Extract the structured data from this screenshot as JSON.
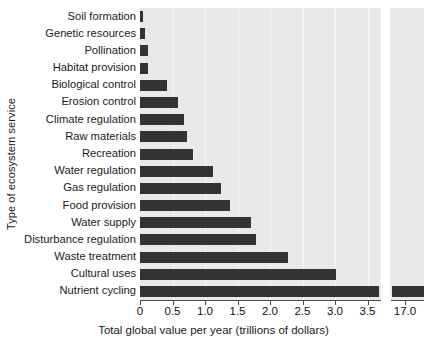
{
  "chart_data": {
    "type": "bar",
    "orientation": "horizontal",
    "title": "",
    "xlabel": "Total global value per year (trillions of dollars)",
    "ylabel": "Type of ecosystem service",
    "categories": [
      "Soil formation",
      "Genetic resources",
      "Pollination",
      "Habitat provision",
      "Biological control",
      "Erosion control",
      "Climate regulation",
      "Raw materials",
      "Recreation",
      "Water regulation",
      "Gas regulation",
      "Food provision",
      "Water supply",
      "Disturbance regulation",
      "Waste treatment",
      "Cultural uses",
      "Nutrient cycling"
    ],
    "values": [
      0.05,
      0.08,
      0.12,
      0.12,
      0.42,
      0.58,
      0.68,
      0.72,
      0.82,
      1.12,
      1.25,
      1.38,
      1.7,
      1.78,
      2.28,
      3.02,
      17.0
    ],
    "xticklabels": [
      "0",
      "0.5",
      "1.0",
      "1.5",
      "2.0",
      "2.5",
      "3.0",
      "3.5",
      "17.0"
    ],
    "xtickvalues": [
      0,
      0.5,
      1.0,
      1.5,
      2.0,
      2.5,
      3.0,
      3.5,
      17.0
    ],
    "xlim": [
      0,
      3.6
    ],
    "axis_break": {
      "after": 3.6,
      "resume_label": "17.0"
    },
    "grid": "vertical-white",
    "legend": "none",
    "bar_color": "#333333",
    "plot_background": "#e9e9e9"
  }
}
